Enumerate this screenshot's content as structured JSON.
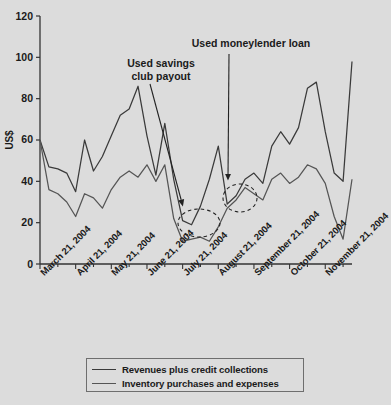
{
  "chart_data": {
    "type": "line",
    "title": "",
    "subtitle": "",
    "xlabel": "",
    "ylabel": "US$",
    "ylim": [
      0,
      120
    ],
    "yticks": [
      0,
      20,
      40,
      60,
      80,
      100,
      120
    ],
    "grid": false,
    "legend_position": "bottom",
    "x_tick_labels": [
      "March 21, 2004",
      "April 21, 2004",
      "May 21, 2004",
      "June 21, 2004",
      "July 21, 2004",
      "August 21, 2004",
      "September 21, 2004",
      "October 21, 2004",
      "November 21, 2004"
    ],
    "x_tick_positions": [
      0,
      4,
      8,
      12,
      16,
      20,
      24,
      28,
      32
    ],
    "x": [
      0,
      1,
      2,
      3,
      4,
      5,
      6,
      7,
      8,
      9,
      10,
      11,
      12,
      13,
      14,
      15,
      16,
      17,
      18,
      19,
      20,
      21,
      22,
      23,
      24,
      25,
      26,
      27,
      28,
      29,
      30,
      31,
      32,
      33,
      34,
      35
    ],
    "series": [
      {
        "name": "Revenues plus credit collections",
        "values": [
          60,
          47,
          46,
          44,
          35,
          60,
          45,
          52,
          62,
          72,
          75,
          86,
          62,
          43,
          68,
          41,
          21,
          19,
          28,
          41,
          57,
          29,
          33,
          41,
          44,
          39,
          57,
          64,
          58,
          66,
          85,
          88,
          64,
          44,
          40,
          98
        ]
      },
      {
        "name": "Inventory purchases and expenses",
        "values": [
          60,
          36,
          34,
          30,
          23,
          34,
          32,
          27,
          36,
          42,
          45,
          42,
          48,
          40,
          48,
          22,
          11,
          12,
          13,
          11,
          18,
          27,
          31,
          37,
          34,
          31,
          41,
          44,
          39,
          42,
          48,
          46,
          39,
          23,
          12,
          41
        ]
      }
    ],
    "annotations": [
      {
        "id": "savings-club",
        "text_line_1": "Used savings",
        "text_line_2": "club payout",
        "target_x": 182,
        "target_y": 203
      },
      {
        "id": "moneylender-loan",
        "text_line_1": "Used moneylender loan",
        "text_line_2": "",
        "target_x": 228,
        "target_y": 177
      }
    ],
    "highlight_ellipses": [
      {
        "id": "dip-ellipse-left",
        "cx": 199,
        "cy": 223,
        "rx": 21,
        "ry": 14
      },
      {
        "id": "dip-ellipse-right",
        "cx": 240,
        "cy": 198,
        "rx": 17,
        "ry": 14
      }
    ]
  },
  "legend": {
    "items": [
      {
        "label": "Revenues plus credit collections"
      },
      {
        "label": "Inventory purchases and expenses"
      }
    ]
  }
}
